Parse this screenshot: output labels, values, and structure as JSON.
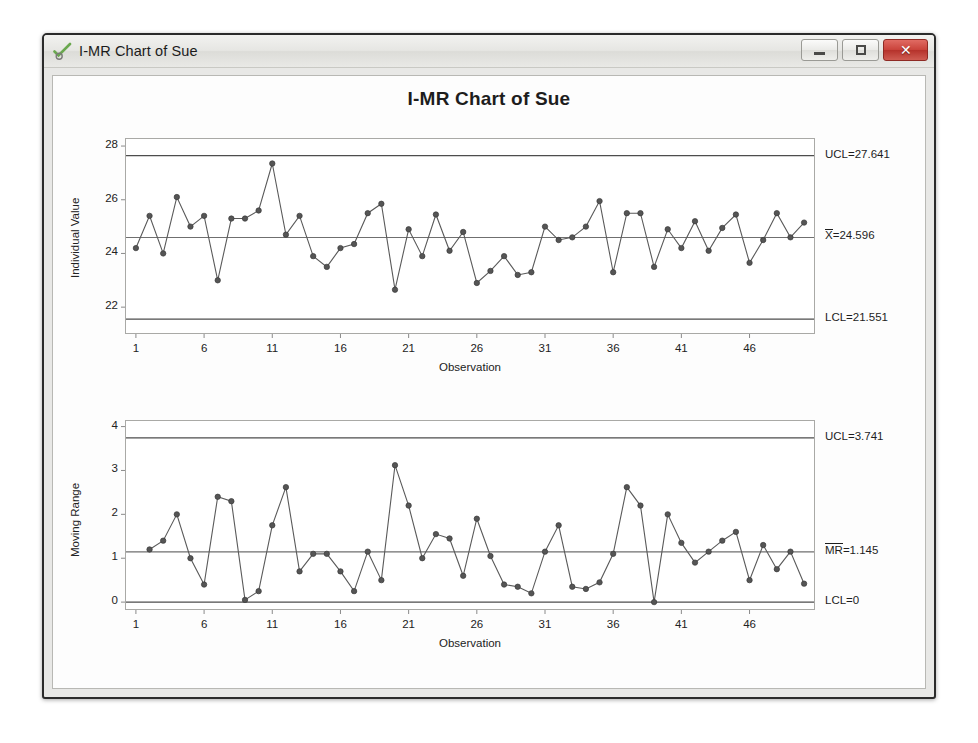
{
  "window": {
    "title": "I-MR Chart of Sue",
    "app_icon": "minitab-check-icon",
    "controls": {
      "minimize_label": "",
      "maximize_label": "",
      "close_label": "✕"
    }
  },
  "chart_data": {
    "type": "line",
    "title": "I-MR Chart of Sue",
    "subcharts": [
      {
        "id": "individuals",
        "ylabel": "Individual Value",
        "xlabel": "Observation",
        "ylim": [
          21.0,
          28.3
        ],
        "yticks": [
          22,
          24,
          26,
          28
        ],
        "xlim": [
          0.2,
          50.8
        ],
        "xticks": [
          1,
          6,
          11,
          16,
          21,
          26,
          31,
          36,
          41,
          46
        ],
        "grid": false,
        "center_line": {
          "label": "X̄=24.596",
          "label_text": "X",
          "label_rest": "=24.596",
          "value": 24.596
        },
        "ucl": {
          "label": "UCL=27.641",
          "value": 27.641
        },
        "lcl": {
          "label": "LCL=21.551",
          "value": 21.551
        },
        "x": [
          1,
          2,
          3,
          4,
          5,
          6,
          7,
          8,
          9,
          10,
          11,
          12,
          13,
          14,
          15,
          16,
          17,
          18,
          19,
          20,
          21,
          22,
          23,
          24,
          25,
          26,
          27,
          28,
          29,
          30,
          31,
          32,
          33,
          34,
          35,
          36,
          37,
          38,
          39,
          40,
          41,
          42,
          43,
          44,
          45,
          46,
          47,
          48,
          49,
          50
        ],
        "values": [
          24.2,
          25.4,
          24.0,
          26.1,
          25.0,
          25.4,
          23.0,
          25.3,
          25.3,
          25.6,
          27.35,
          24.7,
          25.4,
          23.9,
          23.5,
          24.2,
          24.35,
          25.5,
          25.85,
          22.65,
          24.9,
          23.9,
          25.45,
          24.1,
          24.8,
          22.9,
          23.35,
          23.9,
          23.2,
          23.3,
          25.0,
          24.5,
          24.6,
          25.0,
          25.95,
          23.3,
          25.5,
          25.5,
          23.5,
          24.9,
          24.2,
          25.2,
          24.1,
          24.95,
          25.45,
          23.65,
          24.5,
          25.5,
          24.6,
          25.15
        ]
      },
      {
        "id": "moving-range",
        "ylabel": "Moving Range",
        "xlabel": "Observation",
        "ylim": [
          -0.18,
          4.15
        ],
        "yticks": [
          0,
          1,
          2,
          3,
          4
        ],
        "xlim": [
          0.2,
          50.8
        ],
        "xticks": [
          1,
          6,
          11,
          16,
          21,
          26,
          31,
          36,
          41,
          46
        ],
        "grid": false,
        "center_line": {
          "label": "MR=1.145",
          "label_text": "MR",
          "label_rest": "=1.145",
          "value": 1.145
        },
        "ucl": {
          "label": "UCL=3.741",
          "value": 3.741
        },
        "lcl": {
          "label": "LCL=0",
          "value": 0
        },
        "x": [
          2,
          3,
          4,
          5,
          6,
          7,
          8,
          9,
          10,
          11,
          12,
          13,
          14,
          15,
          16,
          17,
          18,
          19,
          20,
          21,
          22,
          23,
          24,
          25,
          26,
          27,
          28,
          29,
          30,
          31,
          32,
          33,
          34,
          35,
          36,
          37,
          38,
          39,
          40,
          41,
          42,
          43,
          44,
          45,
          46,
          47,
          48,
          49,
          50
        ],
        "values": [
          1.2,
          1.4,
          2.0,
          1.0,
          0.4,
          2.4,
          2.3,
          0.05,
          0.25,
          1.75,
          2.62,
          0.7,
          1.1,
          1.1,
          0.7,
          0.25,
          1.15,
          0.5,
          3.12,
          2.2,
          1.0,
          1.55,
          1.45,
          0.6,
          1.9,
          1.05,
          0.4,
          0.35,
          0.2,
          1.15,
          1.75,
          0.35,
          0.3,
          0.45,
          1.1,
          2.62,
          2.2,
          0.0,
          2.0,
          1.35,
          0.9,
          1.15,
          1.4,
          1.6,
          0.5,
          1.3,
          0.75,
          1.15,
          0.42
        ]
      }
    ]
  }
}
